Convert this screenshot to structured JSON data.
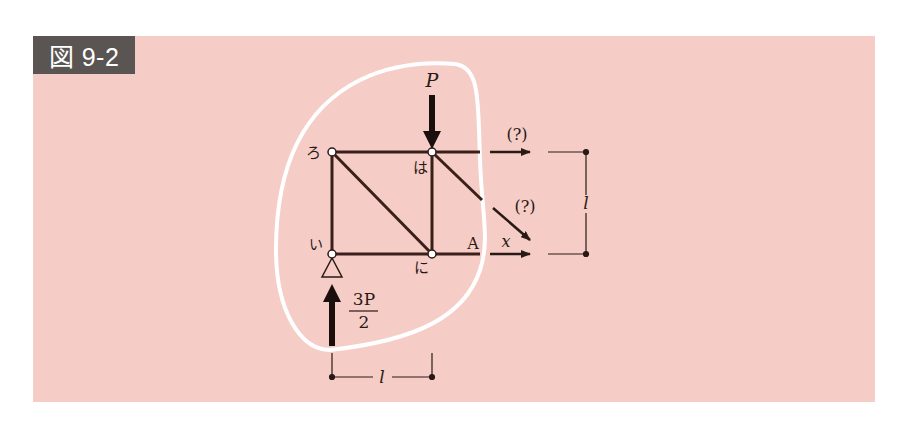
{
  "figure": {
    "label": "図 9-2",
    "background_color": "#f5cdc6",
    "label_bg_color": "#5a5553",
    "member_color": "#3a1f1a",
    "section_curve_color": "#ffffff"
  },
  "diagram": {
    "nodes": {
      "ro": "ろ",
      "ha": "は",
      "i": "い",
      "ni": "に",
      "A": "A"
    },
    "loads": {
      "applied_load": "P",
      "reaction_numerator": "3P",
      "reaction_denominator": "2"
    },
    "unknown_forces": {
      "top_chord": "(?)",
      "diagonal": "(?)",
      "bottom_chord": "x"
    },
    "dimensions": {
      "vertical": "l",
      "horizontal": "l"
    }
  }
}
